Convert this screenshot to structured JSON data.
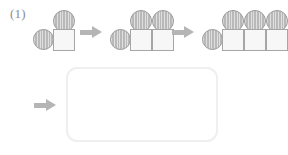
{
  "worksheet": {
    "problem_label": "(1)",
    "type": "growing-pattern-sequence",
    "background_color": "#ffffff",
    "circle_color": "#b9b9b9",
    "circle_border_color": "#9a9a9a",
    "square_color": "#f7f7f7",
    "square_border_color": "#a6a6a6",
    "arrow_color": "#b5b5b5",
    "label_color": "#8d8d8d",
    "answer_box_border_color": "#efefef"
  },
  "sequence": {
    "steps": [
      {
        "index": 1,
        "name": "step-1",
        "squares": 1,
        "top_circles": 1,
        "side_circles": 1,
        "total_circles": 2
      },
      {
        "index": 2,
        "name": "step-2",
        "squares": 2,
        "top_circles": 2,
        "side_circles": 1,
        "total_circles": 3
      },
      {
        "index": 3,
        "name": "step-3",
        "squares": 3,
        "top_circles": 3,
        "side_circles": 1,
        "total_circles": 4
      }
    ],
    "arrows": [
      {
        "name": "arrow-step1-to-step2",
        "direction": "right"
      },
      {
        "name": "arrow-step2-to-step3",
        "direction": "right"
      },
      {
        "name": "arrow-to-answer",
        "direction": "right"
      }
    ]
  },
  "answer": {
    "name": "answer-box",
    "value": "",
    "placeholder": ""
  }
}
